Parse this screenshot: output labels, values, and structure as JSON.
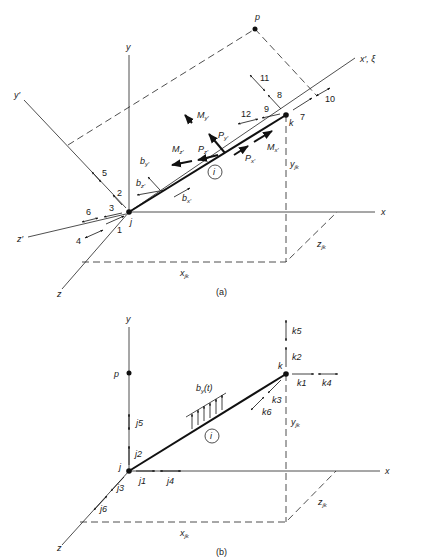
{
  "figure_a": {
    "caption": "(a)",
    "axes": {
      "x": "x",
      "y": "y",
      "z": "z",
      "x_local": "x′, ξ",
      "y_local": "y′",
      "z_local": "z′"
    },
    "nodes": {
      "j": "j",
      "k": "k",
      "p": "p"
    },
    "member_label": "i",
    "dims": {
      "x": "x",
      "x_sub": "jk",
      "y": "y",
      "y_sub": "jk",
      "z": "z",
      "z_sub": "jk"
    },
    "dof_numbers": [
      "1",
      "2",
      "3",
      "4",
      "5",
      "6",
      "7",
      "8",
      "9",
      "10",
      "11",
      "12"
    ],
    "forces": {
      "My": "M",
      "My_sub": "y′",
      "Mz": "M",
      "Mz_sub": "z′",
      "Mx": "M",
      "Mx_sub": "x′",
      "Py": "P",
      "Py_sub": "y′",
      "Pz": "P",
      "Pz_sub": "z′",
      "Px": "P",
      "Px_sub": "x′",
      "by": "b",
      "by_sub": "y′",
      "bz": "b",
      "bz_sub": "z′",
      "bx": "b",
      "bx_sub": "x′"
    }
  },
  "figure_b": {
    "caption": "(b)",
    "axes": {
      "x": "x",
      "y": "y",
      "z": "z"
    },
    "nodes": {
      "j": "j",
      "k": "k",
      "p": "p"
    },
    "member_label": "i",
    "load_label": "b",
    "load_sub": "y",
    "load_arg": "(t)",
    "dims": {
      "x": "x",
      "x_sub": "jk",
      "y": "y",
      "y_sub": "jk",
      "z": "z",
      "z_sub": "jk"
    },
    "j_dofs": [
      "j1",
      "j2",
      "j3",
      "j4",
      "j5",
      "j6"
    ],
    "k_dofs": [
      "k1",
      "k2",
      "k3",
      "k4",
      "k5",
      "k6"
    ]
  }
}
